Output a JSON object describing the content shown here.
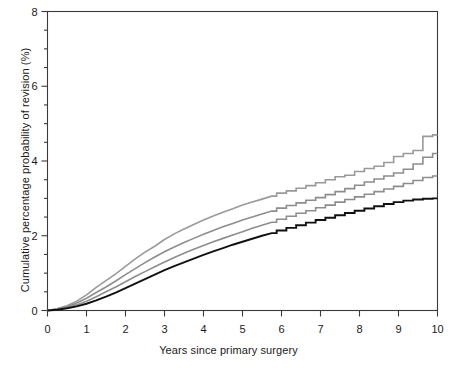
{
  "chart_data": {
    "type": "line",
    "title": "",
    "xlabel": "Years since primary surgery",
    "ylabel": "Cumulative percentage probability of revision (%)",
    "xlim": [
      0,
      10
    ],
    "ylim": [
      0,
      8
    ],
    "grid": false,
    "legend": "none",
    "x_ticks": [
      0,
      1,
      2,
      3,
      4,
      5,
      6,
      7,
      8,
      9,
      10
    ],
    "x_tick_labels": [
      "0",
      "1",
      "2",
      "3",
      "4",
      "5",
      "6",
      "7",
      "8",
      "9",
      "10"
    ],
    "y_ticks": [
      0,
      2,
      4,
      6,
      8
    ],
    "y_tick_labels": [
      "0",
      "2",
      "4",
      "6",
      "8"
    ],
    "y_minor_tick_step": 0.5,
    "x": [
      0,
      0.25,
      0.5,
      0.75,
      1,
      1.25,
      1.5,
      1.75,
      2,
      2.25,
      2.5,
      2.75,
      3,
      3.25,
      3.5,
      3.75,
      4,
      4.25,
      4.5,
      4.75,
      5,
      5.25,
      5.5,
      5.75,
      6,
      6.25,
      6.5,
      6.75,
      7,
      7.25,
      7.5,
      7.75,
      8,
      8.25,
      8.5,
      8.75,
      9,
      9.25,
      9.5,
      9.75,
      10
    ],
    "series": [
      {
        "name": "curve-1-upper",
        "color": "#9a9a9a",
        "width": 1.6,
        "final_value": 4.7,
        "values": [
          0,
          0.05,
          0.13,
          0.25,
          0.42,
          0.62,
          0.8,
          0.98,
          1.18,
          1.38,
          1.56,
          1.72,
          1.9,
          2.05,
          2.18,
          2.3,
          2.42,
          2.53,
          2.63,
          2.72,
          2.82,
          2.9,
          2.98,
          3.06,
          3.14,
          3.2,
          3.27,
          3.34,
          3.42,
          3.5,
          3.58,
          3.62,
          3.72,
          3.8,
          3.86,
          3.96,
          4.12,
          4.2,
          4.28,
          4.66,
          4.7
        ]
      },
      {
        "name": "curve-2",
        "color": "#8d8d8d",
        "width": 1.6,
        "final_value": 4.2,
        "values": [
          0,
          0.04,
          0.1,
          0.2,
          0.33,
          0.48,
          0.63,
          0.79,
          0.96,
          1.12,
          1.28,
          1.43,
          1.57,
          1.7,
          1.82,
          1.93,
          2.04,
          2.14,
          2.24,
          2.33,
          2.42,
          2.5,
          2.58,
          2.66,
          2.74,
          2.81,
          2.88,
          2.95,
          3.02,
          3.1,
          3.18,
          3.26,
          3.35,
          3.44,
          3.52,
          3.6,
          3.68,
          3.78,
          3.92,
          4.1,
          4.2
        ]
      },
      {
        "name": "curve-3",
        "color": "#8d8d8d",
        "width": 1.6,
        "final_value": 3.6,
        "values": [
          0,
          0.03,
          0.08,
          0.15,
          0.25,
          0.37,
          0.5,
          0.63,
          0.77,
          0.91,
          1.04,
          1.17,
          1.3,
          1.42,
          1.53,
          1.64,
          1.74,
          1.84,
          1.93,
          2.02,
          2.11,
          2.2,
          2.28,
          2.36,
          2.44,
          2.52,
          2.6,
          2.67,
          2.75,
          2.82,
          2.9,
          2.97,
          3.04,
          3.11,
          3.18,
          3.25,
          3.32,
          3.4,
          3.48,
          3.56,
          3.6
        ]
      },
      {
        "name": "curve-4-lower",
        "color": "#111111",
        "width": 1.9,
        "final_value": 3.0,
        "values": [
          0,
          0.02,
          0.06,
          0.11,
          0.18,
          0.27,
          0.37,
          0.48,
          0.6,
          0.72,
          0.84,
          0.96,
          1.08,
          1.19,
          1.29,
          1.39,
          1.49,
          1.58,
          1.67,
          1.76,
          1.84,
          1.92,
          2.0,
          2.07,
          2.14,
          2.21,
          2.28,
          2.35,
          2.42,
          2.48,
          2.55,
          2.61,
          2.67,
          2.73,
          2.79,
          2.85,
          2.9,
          2.94,
          2.97,
          2.99,
          3.0
        ]
      }
    ]
  }
}
